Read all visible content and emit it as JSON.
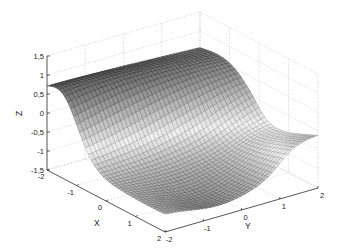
{
  "chart_data": {
    "type": "surface",
    "title": "",
    "xlabel": "X",
    "ylabel": "Y",
    "zlabel": "Z",
    "xlim": [
      -2,
      2
    ],
    "ylim": [
      -2,
      2
    ],
    "zlim": [
      -1.5,
      1.5
    ],
    "x_ticks": [
      -2,
      -1,
      0,
      1,
      2
    ],
    "y_ticks": [
      -2,
      -1,
      0,
      1,
      2
    ],
    "z_ticks": [
      -1.5,
      -1,
      -0.5,
      0,
      0.5,
      1,
      1.5
    ],
    "x_tick_labels": [
      "-2",
      "-1",
      "0",
      "1",
      "2"
    ],
    "y_tick_labels": [
      "-2",
      "-1",
      "0",
      "1",
      "2"
    ],
    "z_tick_labels": [
      "-1,5",
      "-1",
      "-0,5",
      "0",
      "0,5",
      "1",
      "1,5"
    ],
    "grid": true,
    "colormap": "gray",
    "surface_description": "Mesh surface: plateau near z≈0.5 for low X, drops to a trough near z≈-1 around X≈1 to 2, with Y-dependent ridge; gray shading",
    "mesh_resolution": 40
  },
  "labels": {
    "x": "X",
    "y": "Y",
    "z": "Z"
  }
}
